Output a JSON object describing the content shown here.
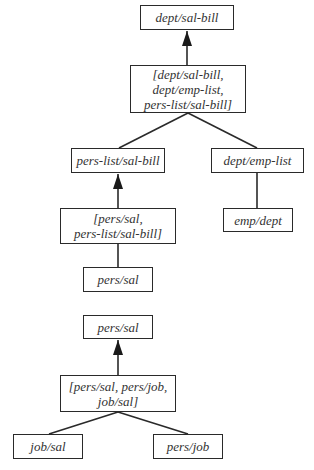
{
  "diagram": {
    "top": {
      "nodes": [
        {
          "id": "n1",
          "label": "dept/sal-bill",
          "x": 140,
          "y": 5,
          "w": 94,
          "h": 25
        },
        {
          "id": "n2",
          "label": "[dept/sal-bill,\ndept/emp-list,\npers-list/sal-bill]",
          "x": 130,
          "y": 65,
          "w": 116,
          "h": 48
        },
        {
          "id": "n3",
          "label": "pers-list/sal-bill",
          "x": 71,
          "y": 148,
          "w": 94,
          "h": 25
        },
        {
          "id": "n4",
          "label": "dept/emp-list",
          "x": 211,
          "y": 148,
          "w": 93,
          "h": 25
        },
        {
          "id": "n5",
          "label": "[pers/sal,\npers-list/sal-bill]",
          "x": 60,
          "y": 208,
          "w": 116,
          "h": 36
        },
        {
          "id": "n6",
          "label": "emp/dept",
          "x": 223,
          "y": 208,
          "w": 70,
          "h": 24
        },
        {
          "id": "n7",
          "label": "pers/sal",
          "x": 83,
          "y": 267,
          "w": 70,
          "h": 25
        }
      ]
    },
    "bottom": {
      "nodes": [
        {
          "id": "m1",
          "label": "pers/sal",
          "x": 83,
          "y": 315,
          "w": 70,
          "h": 24
        },
        {
          "id": "m2",
          "label": "[pers/sal, pers/job,\njob/sal]",
          "x": 60,
          "y": 375,
          "w": 116,
          "h": 37
        },
        {
          "id": "m3",
          "label": "job/sal",
          "x": 13,
          "y": 434,
          "w": 70,
          "h": 25
        },
        {
          "id": "m4",
          "label": "pers/job",
          "x": 153,
          "y": 434,
          "w": 70,
          "h": 25
        }
      ]
    },
    "edges": [
      {
        "from": "n2",
        "to": "n1",
        "type": "arrow"
      },
      {
        "from": "n2",
        "to": "n3",
        "type": "line"
      },
      {
        "from": "n2",
        "to": "n4",
        "type": "line"
      },
      {
        "from": "n5",
        "to": "n3",
        "type": "arrow"
      },
      {
        "from": "n4",
        "to": "n6",
        "type": "line"
      },
      {
        "from": "n5",
        "to": "n7",
        "type": "line"
      },
      {
        "from": "m2",
        "to": "m1",
        "type": "arrow"
      },
      {
        "from": "m2",
        "to": "m3",
        "type": "line"
      },
      {
        "from": "m2",
        "to": "m4",
        "type": "line"
      }
    ],
    "colors": {
      "stroke": "#2a2a2a",
      "text": "#333333",
      "background": "#ffffff"
    }
  }
}
